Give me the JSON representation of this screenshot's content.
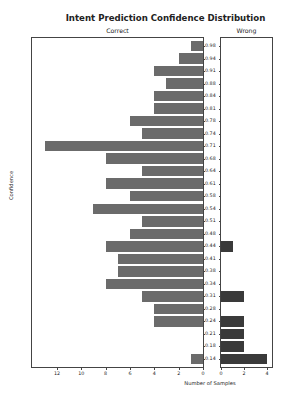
{
  "chart_data": {
    "type": "bar",
    "orientation": "horizontal",
    "title": "Intent Prediction Confidence Distribution",
    "xlabel": "Number of Samples",
    "ylabel": "Confidence",
    "grid": false,
    "legend": null,
    "panels": [
      {
        "name": "Correct",
        "direction": "mirrored-left",
        "xlim": [
          13.8,
          0
        ],
        "xticks": [
          12,
          10,
          8,
          6,
          4,
          2,
          0
        ],
        "color": "#6b6b6b"
      },
      {
        "name": "Wrong",
        "direction": "right",
        "xlim": [
          0,
          4.4
        ],
        "xticks": [
          0,
          2,
          4
        ],
        "color": "#3a3a3a"
      }
    ],
    "categories": [
      "0.98",
      "0.94",
      "0.91",
      "0.88",
      "0.84",
      "0.81",
      "0.78",
      "0.74",
      "0.71",
      "0.68",
      "0.64",
      "0.61",
      "0.58",
      "0.54",
      "0.51",
      "0.48",
      "0.44",
      "0.41",
      "0.38",
      "0.34",
      "0.31",
      "0.28",
      "0.24",
      "0.21",
      "0.18",
      "0.14"
    ],
    "series": [
      {
        "name": "Correct",
        "values": [
          1,
          2,
          4,
          3,
          4,
          4,
          6,
          5,
          13,
          8,
          5,
          8,
          6,
          9,
          5,
          6,
          8,
          7,
          7,
          8,
          5,
          4,
          4,
          0,
          0,
          1
        ]
      },
      {
        "name": "Wrong",
        "values": [
          0,
          0,
          0,
          0,
          0,
          0,
          0,
          0,
          0,
          0,
          0,
          0,
          0,
          0,
          0,
          0,
          1,
          0,
          0,
          0,
          2,
          0,
          2,
          2,
          2,
          4
        ]
      }
    ]
  }
}
